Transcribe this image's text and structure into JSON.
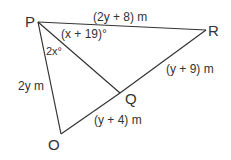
{
  "diagram": {
    "vertices": {
      "P": {
        "label": "P",
        "x": 38,
        "y": 22
      },
      "R": {
        "label": "R",
        "x": 206,
        "y": 30
      },
      "Q": {
        "label": "Q",
        "x": 120,
        "y": 93
      },
      "O": {
        "label": "O",
        "x": 61,
        "y": 134
      }
    },
    "edges": [
      {
        "from": "P",
        "to": "R",
        "label": "(2y + 8) m"
      },
      {
        "from": "R",
        "to": "Q",
        "label": "(y + 9) m"
      },
      {
        "from": "Q",
        "to": "O",
        "label": "(y + 4) m"
      },
      {
        "from": "O",
        "to": "P",
        "label": "2y m"
      },
      {
        "from": "P",
        "to": "Q",
        "label": ""
      }
    ],
    "angles": {
      "QPR": "(x + 19)°",
      "OPQ": "2x°"
    },
    "line_color": "#333333"
  }
}
